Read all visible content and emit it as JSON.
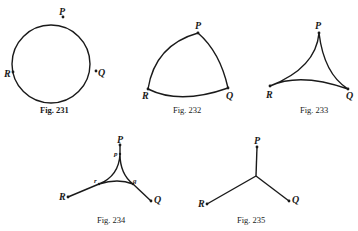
{
  "figures": [
    {
      "id": "fig231",
      "caption": "Fig. 231",
      "shape": "circle",
      "labels": {
        "P": "P",
        "Q": "Q",
        "R": "R"
      }
    },
    {
      "id": "fig232",
      "caption": "Fig. 232",
      "shape": "convex-curved-triangle",
      "labels": {
        "P": "P",
        "Q": "Q",
        "R": "R"
      }
    },
    {
      "id": "fig233",
      "caption": "Fig. 233",
      "shape": "concave-curved-triangle",
      "labels": {
        "P": "P",
        "Q": "Q",
        "R": "R"
      }
    },
    {
      "id": "fig234",
      "caption": "Fig. 234",
      "shape": "concave-triangle-with-spokes",
      "labels": {
        "P": "P",
        "Q": "Q",
        "R": "R",
        "p": "p",
        "q": "q",
        "r": "r"
      }
    },
    {
      "id": "fig235",
      "caption": "Fig. 235",
      "shape": "steiner-tree",
      "labels": {
        "P": "P",
        "Q": "Q",
        "R": "R"
      }
    }
  ],
  "colors": {
    "ink": "#1a1a1a",
    "background": "#ffffff"
  }
}
